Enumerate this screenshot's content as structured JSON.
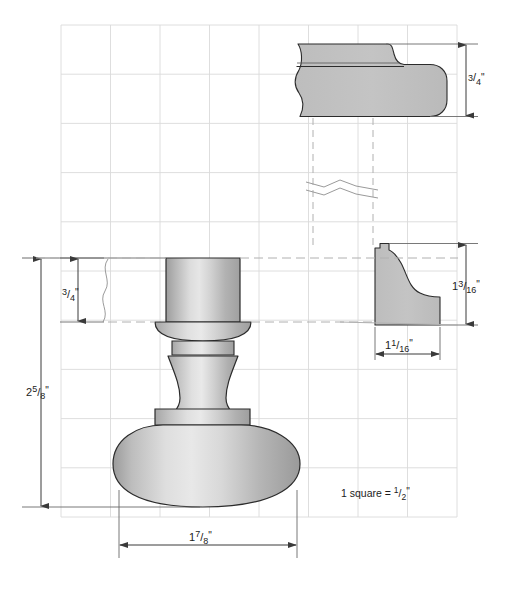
{
  "drawing": {
    "title": "Turned finial / bun foot detail drawing",
    "scale_note": "1 square = ½\"",
    "scale_note_parts": {
      "prefix": "1 square = ",
      "numerator": "1",
      "denominator": "2",
      "suffix": "\""
    },
    "background_color": "#ffffff",
    "grid": {
      "visible": true,
      "square_value": "1/2\"",
      "line_color": "#d8d8d8",
      "origin_x": 61,
      "origin_y": 25,
      "spacing": 49.5,
      "cols": 8,
      "rows": 10
    },
    "part_fill_light": "#e2e2e2",
    "part_fill_mid": "#b8b8b8",
    "part_fill_dark": "#9a9a9a",
    "outline_color": "#2b2b2b",
    "dimension_color": "#3a3a3a"
  },
  "views": {
    "top_profile": {
      "name": "upper molding profile section",
      "dimension_label": "3/4\"",
      "dimension_numerator": "3",
      "dimension_denominator": "4",
      "dimension_unit": "\""
    },
    "bottom_profile": {
      "name": "lower cove molding profile section",
      "height_label": "13/16\"",
      "height_numerator": "13",
      "height_denominator": "16",
      "height_unit": "\"",
      "width_label": "11/16\"",
      "width_numerator": "11",
      "width_denominator": "16",
      "width_unit": "\""
    },
    "elevation": {
      "name": "finial front elevation",
      "overall_height_label": "2 5/8\"",
      "overall_height_whole": "2",
      "overall_height_numerator": "5",
      "overall_height_denominator": "8",
      "overall_height_unit": "\"",
      "tenon_height_label": "3/4\"",
      "tenon_height_numerator": "3",
      "tenon_height_denominator": "4",
      "tenon_height_unit": "\"",
      "overall_width_label": "1 7/8\"",
      "overall_width_whole": "1",
      "overall_width_numerator": "7",
      "overall_width_denominator": "8",
      "overall_width_unit": "\""
    }
  },
  "annotations": {
    "break_line_upper": "break line (section omitted)",
    "break_line_left": "break line on extension"
  }
}
